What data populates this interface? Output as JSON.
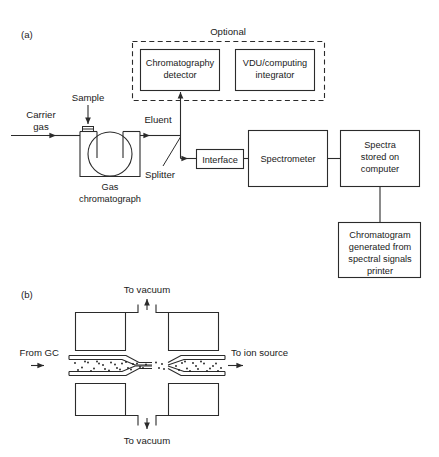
{
  "figure": {
    "panels": [
      {
        "id": "a",
        "label": "(a)",
        "caption_hidden": ""
      },
      {
        "id": "b",
        "label": "(b)",
        "caption_hidden": ""
      }
    ]
  },
  "panel_a": {
    "label": "(a)",
    "optional_group": {
      "title": "Optional",
      "boxes": [
        {
          "id": "chromatography-detector",
          "line1": "Chromatography",
          "line2": "detector"
        },
        {
          "id": "vdu-computing-integrator",
          "line1": "VDU/computing",
          "line2": "integrator"
        }
      ]
    },
    "flow_labels": {
      "carrier_gas_line1": "Carrier",
      "carrier_gas_line2": "gas",
      "sample": "Sample",
      "eluent": "Eluent",
      "splitter": "Splitter"
    },
    "gas_chromatograph": {
      "label_line1": "Gas",
      "label_line2": "chromatograph"
    },
    "boxes": [
      {
        "id": "interface",
        "line1": "Interface"
      },
      {
        "id": "spectrometer",
        "line1": "Spectrometer"
      },
      {
        "id": "spectra-stored-on-computer",
        "line1": "Spectra",
        "line2": "stored on",
        "line3": "computer"
      },
      {
        "id": "chromatogram-printer",
        "line1": "Chromatogram",
        "line2": "generated from",
        "line3": "spectral signals",
        "line4": "printer"
      }
    ]
  },
  "panel_b": {
    "label": "(b)",
    "labels": {
      "to_vacuum_top": "To vacuum",
      "to_vacuum_bottom": "To vacuum",
      "from_gc": "From GC",
      "to_ion_source": "To ion source"
    }
  },
  "style": {
    "stroke_color": "#2b2b2b",
    "text_color": "#1a1a1a",
    "background": "#ffffff"
  }
}
